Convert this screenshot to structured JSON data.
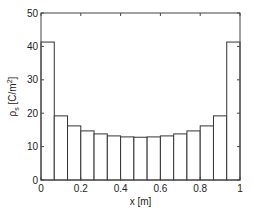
{
  "chart_data": {
    "type": "bar",
    "title": "",
    "xlabel": "x [m]",
    "ylabel": "ρs [C/m²]",
    "ylabel_parts": {
      "symbol": "ρ",
      "subscript": "s",
      "unit_open": " [C/m",
      "sup": "2",
      "unit_close": "]"
    },
    "xlim": [
      0,
      1
    ],
    "ylim": [
      0,
      50
    ],
    "xticks": [
      0,
      0.2,
      0.4,
      0.6,
      0.8,
      1
    ],
    "xtick_labels": [
      "0",
      "0.2",
      "0.4",
      "0.6",
      "0.8",
      "1"
    ],
    "yticks": [
      0,
      10,
      20,
      30,
      40,
      50
    ],
    "ytick_labels": [
      "0",
      "10",
      "20",
      "30",
      "40",
      "50"
    ],
    "grid": false,
    "legend": null,
    "bar_count": 15,
    "bin_edges": [
      0,
      0.0667,
      0.1333,
      0.2,
      0.2667,
      0.3333,
      0.4,
      0.4667,
      0.5333,
      0.6,
      0.6667,
      0.7333,
      0.8,
      0.8667,
      0.9333,
      1.0
    ],
    "categories": [
      "0.033",
      "0.100",
      "0.167",
      "0.233",
      "0.300",
      "0.367",
      "0.433",
      "0.500",
      "0.567",
      "0.633",
      "0.700",
      "0.767",
      "0.833",
      "0.900",
      "0.967"
    ],
    "values": [
      41.3,
      19.2,
      16.2,
      14.7,
      13.8,
      13.2,
      12.9,
      12.8,
      12.9,
      13.2,
      13.8,
      14.7,
      16.2,
      19.2,
      41.3
    ],
    "bar_fill": "#ffffff",
    "bar_stroke": "#333333"
  }
}
